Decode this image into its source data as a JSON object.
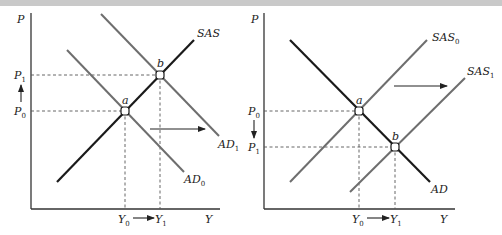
{
  "panels": [
    {
      "id": "left",
      "axis": {
        "y_label": "P",
        "x_label": "Y"
      },
      "curves": {
        "sas": "SAS",
        "ad0": "AD",
        "ad0_sub": "0",
        "ad1": "AD",
        "ad1_sub": "1"
      },
      "points": {
        "a": "a",
        "b": "b"
      },
      "price_labels": {
        "p1": "P",
        "p1_sub": "1",
        "p0": "P",
        "p0_sub": "0"
      },
      "output_labels": {
        "y0": "Y",
        "y0_sub": "0",
        "y1": "Y",
        "y1_sub": "1"
      },
      "price_arrow": "up",
      "shift_arrow": "right",
      "description": "Aggregate demand increases from AD0 to AD1; equilibrium moves from a to b; price rises P0→P1, output rises Y0→Y1"
    },
    {
      "id": "right",
      "axis": {
        "y_label": "P",
        "x_label": "Y"
      },
      "curves": {
        "sas0": "SAS",
        "sas0_sub": "0",
        "sas1": "SAS",
        "sas1_sub": "1",
        "ad": "AD"
      },
      "points": {
        "a": "a",
        "b": "b"
      },
      "price_labels": {
        "p0": "P",
        "p0_sub": "0",
        "p1": "P",
        "p1_sub": "1"
      },
      "output_labels": {
        "y0": "Y",
        "y0_sub": "0",
        "y1": "Y",
        "y1_sub": "1"
      },
      "price_arrow": "down",
      "shift_arrow": "right",
      "description": "Short-run aggregate supply increases from SAS0 to SAS1; equilibrium moves from a to b; price falls P0→P1, output rises Y0→Y1"
    }
  ],
  "colors": {
    "curve_dark": "#1a1a1a",
    "curve_gray": "#6e6e6e",
    "axis": "#333333",
    "dashed": "#555555",
    "header_bar": "#c9c9c9"
  }
}
